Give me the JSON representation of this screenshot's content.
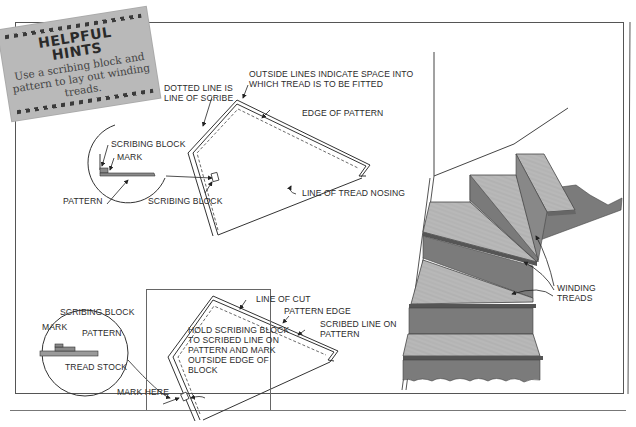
{
  "hint": {
    "title_line1": "HELPFUL",
    "title_line2": "HINTS",
    "body": "Use a scribing block and pattern to lay out winding treads.",
    "background_color": "#b9b9b9"
  },
  "top_diagram": {
    "labels": {
      "outside_lines": "OUTSIDE LINES INDICATE SPACE INTO WHICH TREAD IS TO BE FITTED",
      "dotted_line": "DOTTED LINE IS LINE OF SCRIBE",
      "edge_of_pattern": "EDGE OF PATTERN",
      "line_of_tread_nosing": "LINE OF TREAD NOSING",
      "scribing_block": "SCRIBING BLOCK"
    },
    "detail_circle": {
      "scribing_block": "SCRIBING BLOCK",
      "mark": "MARK",
      "pattern": "PATTERN"
    }
  },
  "bottom_diagram": {
    "labels": {
      "line_of_cut": "LINE OF CUT",
      "pattern_edge": "PATTERN EDGE",
      "scribed_line": "SCRIBED LINE ON PATTERN",
      "instruction": "HOLD SCRIBING BLOCK TO SCRIBED LINE ON PATTERN AND MARK OUTSIDE EDGE OF BLOCK",
      "mark_here": "MARK HERE"
    },
    "detail_circle": {
      "scribing_block": "SCRIBING BLOCK",
      "mark": "MARK",
      "pattern": "PATTERN",
      "tread_stock": "TREAD STOCK"
    }
  },
  "stair_illustration": {
    "label": "WINDING TREADS"
  }
}
